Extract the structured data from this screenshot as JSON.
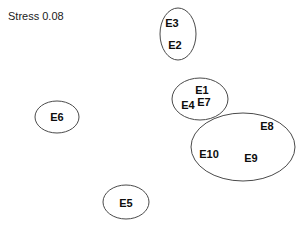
{
  "figure": {
    "annotation": "Stress 0.08",
    "annotation_name": "stress-annotation",
    "background_color": "#ffffff",
    "outline_color": "#4a4a4a",
    "label_color": "#0d0d0d"
  },
  "chart_data": {
    "type": "scatter",
    "title": "",
    "subtitle": "",
    "xlabel": "",
    "ylabel": "",
    "grid": false,
    "legend": "none",
    "axes_visible": false,
    "annotations": [
      {
        "text": "Stress 0.08",
        "x": 8,
        "y": 11
      }
    ],
    "points": [
      {
        "label": "E3",
        "x": 172,
        "y": 23,
        "cluster": 1
      },
      {
        "label": "E2",
        "x": 175,
        "y": 45,
        "cluster": 1
      },
      {
        "label": "E1",
        "x": 202,
        "y": 90,
        "cluster": 2
      },
      {
        "label": "E7",
        "x": 204,
        "y": 102,
        "cluster": 2
      },
      {
        "label": "E4",
        "x": 188,
        "y": 105,
        "cluster": 2
      },
      {
        "label": "E8",
        "x": 267,
        "y": 126,
        "cluster": 3
      },
      {
        "label": "E10",
        "x": 209,
        "y": 154,
        "cluster": 3
      },
      {
        "label": "E9",
        "x": 251,
        "y": 158,
        "cluster": 3
      },
      {
        "label": "E6",
        "x": 57,
        "y": 117,
        "cluster": 4
      },
      {
        "label": "E5",
        "x": 126,
        "y": 203,
        "cluster": 5
      }
    ],
    "clusters": [
      {
        "id": 1,
        "members": [
          "E3",
          "E2"
        ],
        "cx": 178,
        "cy": 34,
        "rx": 18,
        "ry": 26
      },
      {
        "id": 2,
        "members": [
          "E1",
          "E7",
          "E4"
        ],
        "cx": 200,
        "cy": 99,
        "rx": 28,
        "ry": 21
      },
      {
        "id": 3,
        "members": [
          "E8",
          "E10",
          "E9"
        ],
        "cx": 243,
        "cy": 147,
        "rx": 52,
        "ry": 34
      },
      {
        "id": 4,
        "members": [
          "E6"
        ],
        "cx": 57,
        "cy": 117,
        "rx": 22,
        "ry": 16
      },
      {
        "id": 5,
        "members": [
          "E5"
        ],
        "cx": 126,
        "cy": 202,
        "rx": 23,
        "ry": 17
      }
    ]
  }
}
